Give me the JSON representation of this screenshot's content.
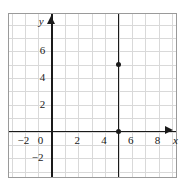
{
  "chart_data": {
    "type": "line",
    "title": "",
    "xlabel": "x",
    "ylabel": "y",
    "xlim": [
      -3.2,
      9.3
    ],
    "ylim": [
      -3.4,
      8.8
    ],
    "grid": true,
    "grid_step": 1,
    "legend": "none",
    "x_ticks": [
      {
        "value": -2,
        "label": "−2"
      },
      {
        "value": 0,
        "label": "0"
      },
      {
        "value": 2,
        "label": "2"
      },
      {
        "value": 4,
        "label": "4"
      },
      {
        "value": 6,
        "label": "6"
      },
      {
        "value": 8,
        "label": "8"
      }
    ],
    "y_ticks": [
      {
        "value": 6,
        "label": "6"
      },
      {
        "value": 4,
        "label": "4"
      },
      {
        "value": 2,
        "label": "2"
      },
      {
        "value": 0,
        "label": "0"
      },
      {
        "value": -2,
        "label": "−2"
      }
    ],
    "series": [
      {
        "name": "vertical-line",
        "type": "line",
        "equation": "x = 5",
        "orientation": "vertical",
        "x": 5,
        "color": "#1a1a1a"
      }
    ],
    "points": [
      {
        "x": 5,
        "y": 5,
        "label": ""
      },
      {
        "x": 5,
        "y": 0,
        "label": ""
      }
    ],
    "axis_arrows": {
      "x": "right",
      "y": "up"
    }
  },
  "style": {
    "background": "#ffffff",
    "grid_color": "#d9d9d9",
    "axis_color": "#1a1a1a",
    "frame_color": "#9a9a9a",
    "point_color": "#1a1a1a"
  }
}
